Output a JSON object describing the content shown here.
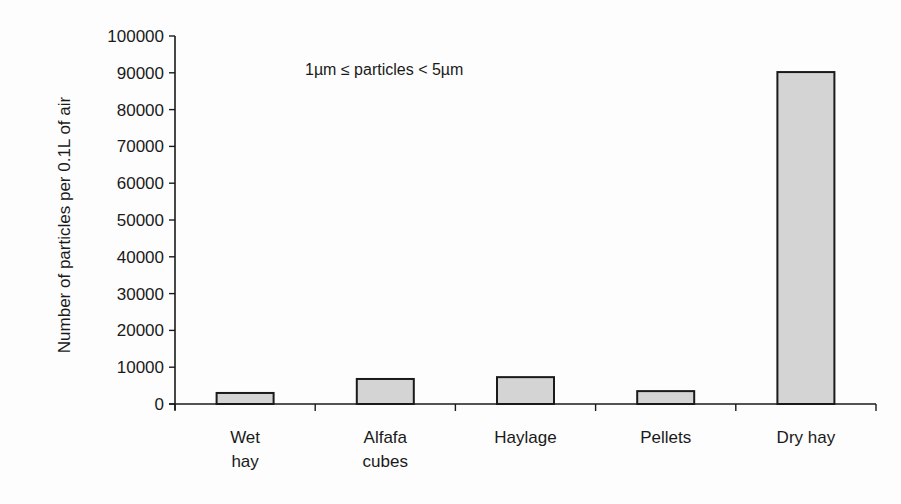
{
  "chart_data": {
    "type": "bar",
    "title": "",
    "annotation": "1µm ≤ particles < 5µm",
    "xlabel": "",
    "ylabel": "Number of particles per 0.1L of air",
    "categories": [
      "Wet hay",
      "Alfafa cubes",
      "Haylage",
      "Pellets",
      "Dry hay"
    ],
    "category_lines": [
      [
        "Wet",
        "hay"
      ],
      [
        "Alfafa",
        "cubes"
      ],
      [
        "Haylage"
      ],
      [
        "Pellets"
      ],
      [
        "Dry hay"
      ]
    ],
    "values": [
      3000,
      6800,
      7300,
      3500,
      90200
    ],
    "ylim": [
      0,
      100000
    ],
    "yticks": [
      0,
      10000,
      20000,
      30000,
      40000,
      50000,
      60000,
      70000,
      80000,
      90000,
      100000
    ],
    "grid": false,
    "legend": null,
    "colors": {
      "bar_fill": "#d4d4d4",
      "bar_stroke": "#1a1a1a",
      "axis": "#1a1a1a"
    }
  }
}
